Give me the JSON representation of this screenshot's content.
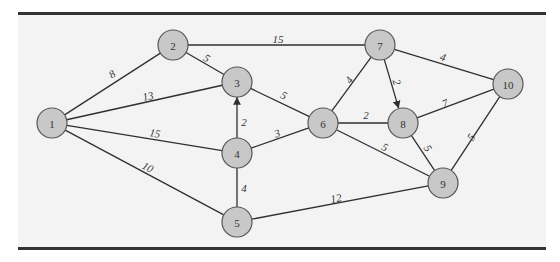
{
  "diagram": {
    "type": "weighted network graph",
    "colors": {
      "background": "#f3f3f3",
      "node_fill": "#c8c8c8",
      "node_stroke": "#555555",
      "edge": "#2f2f2f",
      "rule": "#333333"
    },
    "nodes": [
      {
        "id": "1",
        "label": "1",
        "x": 52,
        "y": 123
      },
      {
        "id": "2",
        "label": "2",
        "x": 173,
        "y": 45
      },
      {
        "id": "3",
        "label": "3",
        "x": 237,
        "y": 82
      },
      {
        "id": "4",
        "label": "4",
        "x": 237,
        "y": 153
      },
      {
        "id": "5",
        "label": "5",
        "x": 237,
        "y": 222
      },
      {
        "id": "6",
        "label": "6",
        "x": 323,
        "y": 123
      },
      {
        "id": "7",
        "label": "7",
        "x": 380,
        "y": 45
      },
      {
        "id": "8",
        "label": "8",
        "x": 403,
        "y": 123
      },
      {
        "id": "9",
        "label": "9",
        "x": 443,
        "y": 183
      },
      {
        "id": "10",
        "label": "10",
        "x": 508,
        "y": 84
      }
    ],
    "edges": [
      {
        "from": "1",
        "to": "2",
        "weight": "8",
        "lx": 112,
        "ly": 74,
        "directed": false
      },
      {
        "from": "1",
        "to": "3",
        "weight": "13",
        "lx": 148,
        "ly": 96,
        "directed": false
      },
      {
        "from": "1",
        "to": "4",
        "weight": "15",
        "lx": 155,
        "ly": 133,
        "directed": false
      },
      {
        "from": "1",
        "to": "5",
        "weight": "10",
        "lx": 148,
        "ly": 167,
        "directed": false
      },
      {
        "from": "2",
        "to": "3",
        "weight": "5",
        "lx": 207,
        "ly": 58,
        "directed": false
      },
      {
        "from": "2",
        "to": "7",
        "weight": "15",
        "lx": 278,
        "ly": 39,
        "directed": false
      },
      {
        "from": "4",
        "to": "3",
        "weight": "2",
        "lx": 244,
        "ly": 122,
        "directed": true
      },
      {
        "from": "3",
        "to": "6",
        "weight": "5",
        "lx": 284,
        "ly": 95,
        "directed": false
      },
      {
        "from": "4",
        "to": "6",
        "weight": "3",
        "lx": 277,
        "ly": 133,
        "directed": false
      },
      {
        "from": "4",
        "to": "5",
        "weight": "4",
        "lx": 244,
        "ly": 188,
        "directed": false
      },
      {
        "from": "5",
        "to": "9",
        "weight": "12",
        "lx": 336,
        "ly": 198,
        "directed": false
      },
      {
        "from": "6",
        "to": "7",
        "weight": "4",
        "lx": 349,
        "ly": 80,
        "directed": false
      },
      {
        "from": "6",
        "to": "8",
        "weight": "2",
        "lx": 366,
        "ly": 115,
        "directed": false
      },
      {
        "from": "6",
        "to": "9",
        "weight": "5",
        "lx": 385,
        "ly": 147,
        "directed": false
      },
      {
        "from": "7",
        "to": "8",
        "weight": "2",
        "lx": 397,
        "ly": 82,
        "directed": true
      },
      {
        "from": "7",
        "to": "10",
        "weight": "4",
        "lx": 443,
        "ly": 57,
        "directed": false
      },
      {
        "from": "8",
        "to": "10",
        "weight": "7",
        "lx": 445,
        "ly": 103,
        "directed": false
      },
      {
        "from": "8",
        "to": "9",
        "weight": "5",
        "lx": 428,
        "ly": 148,
        "directed": false
      },
      {
        "from": "9",
        "to": "10",
        "weight": "5",
        "lx": 471,
        "ly": 137,
        "directed": false
      }
    ]
  }
}
